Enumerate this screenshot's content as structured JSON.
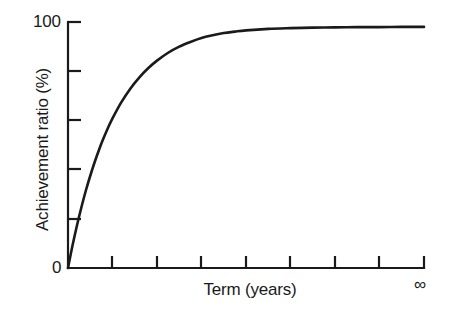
{
  "chart_data": {
    "type": "line",
    "title": "",
    "subtitle": "",
    "xlabel": "Term (years)",
    "ylabel": "Achievement ratio (%)",
    "legend": [],
    "legend_position": "none",
    "grid": false,
    "xlim": [
      0,
      8
    ],
    "ylim": [
      0,
      100
    ],
    "y_tick_labels": [
      "0",
      "100"
    ],
    "y_tick_values": [
      0,
      100
    ],
    "y_minor_tick_values": [
      20,
      40,
      60,
      80,
      100
    ],
    "x_tick_labels": [
      "",
      "",
      "",
      "",
      "",
      "",
      "",
      "∞"
    ],
    "x_tick_values": [
      1,
      2,
      3,
      4,
      5,
      6,
      7,
      8
    ],
    "x_end_label": "∞",
    "series": [
      {
        "name": "Achievement ratio",
        "curve": "exponential saturation",
        "x": [
          0,
          0.1,
          0.2,
          0.3,
          0.4,
          0.5,
          0.6,
          0.7,
          0.8,
          0.9,
          1.0,
          1.2,
          1.4,
          1.6,
          1.8,
          2.0,
          2.25,
          2.5,
          2.75,
          3.0,
          3.25,
          3.5,
          3.75,
          4.0,
          4.5,
          5.0,
          5.5,
          6.0,
          6.5,
          7.0,
          7.5,
          8.0
        ],
        "values": [
          0,
          9.0,
          17.2,
          24.6,
          31.4,
          37.5,
          43.1,
          48.2,
          52.8,
          57.0,
          60.8,
          67.4,
          72.9,
          77.4,
          81.2,
          84.3,
          87.5,
          90.0,
          91.9,
          93.5,
          94.6,
          95.5,
          96.1,
          96.6,
          97.2,
          97.5,
          97.7,
          97.8,
          97.9,
          97.9,
          98.0,
          98.0
        ]
      }
    ],
    "colors": {
      "curve": "#1a1a1a",
      "axis": "#1a1a1a",
      "background": "#ffffff"
    }
  },
  "labels": {
    "y_title": "Achievement ratio (%)",
    "x_title": "Term (years)",
    "y_top": "100",
    "y_bottom": "0",
    "x_infinity": "∞"
  }
}
